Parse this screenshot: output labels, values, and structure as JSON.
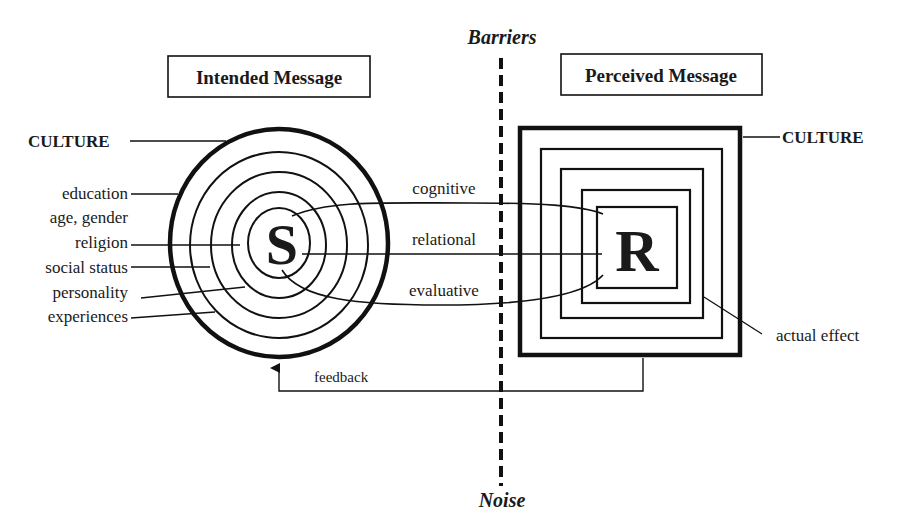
{
  "barrier": {
    "top_label": "Barriers",
    "bottom_label": "Noise"
  },
  "sender": {
    "box_label": "Intended Message",
    "letter": "S",
    "culture_label": "CULTURE",
    "layers": [
      "education",
      "age, gender",
      "religion",
      "social status",
      "personality",
      "experiences"
    ]
  },
  "receiver": {
    "box_label": "Perceived Message",
    "letter": "R",
    "culture_label": "CULTURE",
    "effect_label": "actual effect"
  },
  "channels": [
    "cognitive",
    "relational",
    "evaluative"
  ],
  "feedback_label": "feedback",
  "colors": {
    "ink": "#111111",
    "background": "#ffffff"
  }
}
